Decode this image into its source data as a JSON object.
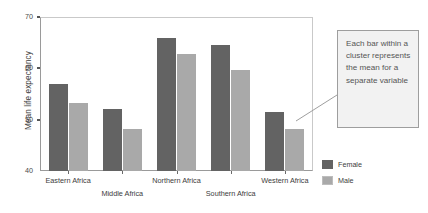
{
  "chart_data": {
    "type": "bar",
    "title": "",
    "xlabel": "",
    "ylabel": "Mean life expectancy",
    "ylim": [
      40,
      70
    ],
    "yticks": [
      40,
      50,
      60,
      70
    ],
    "grid": false,
    "legend_position": "right",
    "categories": [
      "Eastern Africa",
      "Middle Africa",
      "Northern Africa",
      "Southern Africa",
      "Western Africa"
    ],
    "series": [
      {
        "name": "Female",
        "color": "#636363",
        "values": [
          57.0,
          52.2,
          66.0,
          64.7,
          51.5
        ]
      },
      {
        "name": "Male",
        "color": "#a9a9a9",
        "values": [
          53.4,
          48.2,
          63.0,
          59.8,
          48.3
        ]
      }
    ],
    "annotations": [
      {
        "text": "Each bar within a cluster represents the mean for a separate variable",
        "points_to": "Western Africa / Male bar"
      }
    ]
  },
  "axis": {
    "y_title": "Mean life expectancy",
    "y_tick_labels": [
      "70",
      "60",
      "50",
      "40"
    ]
  },
  "legend": {
    "items": [
      {
        "label": "Female",
        "swatch": "female"
      },
      {
        "label": "Male",
        "swatch": "male"
      }
    ]
  },
  "callout": {
    "text": "Each bar within a cluster represents the mean for a separate variable"
  }
}
